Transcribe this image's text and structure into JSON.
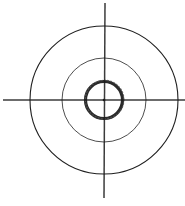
{
  "diagram": {
    "type": "concentric-circles-with-crosshair",
    "background": "#ffffff",
    "stroke_color": "#1a1a1a",
    "center": {
      "x": 104,
      "y": 100
    },
    "circles": [
      {
        "name": "outer",
        "r": 74,
        "stroke_width": 1.1,
        "color": "#1f1f1f"
      },
      {
        "name": "middle",
        "r": 42,
        "stroke_width": 0.9,
        "color": "#3a3a3a"
      },
      {
        "name": "inner",
        "r": 18.5,
        "stroke_width": 3.2,
        "color": "#2a2a2a"
      }
    ],
    "crosshair": {
      "horizontal": {
        "x1": 3,
        "y1": 100,
        "x2": 185,
        "y2": 100,
        "stroke_width": 1.6
      },
      "vertical": {
        "x1": 105,
        "y1": 3,
        "x2": 104,
        "y2": 198,
        "stroke_width": 1.5
      }
    }
  }
}
